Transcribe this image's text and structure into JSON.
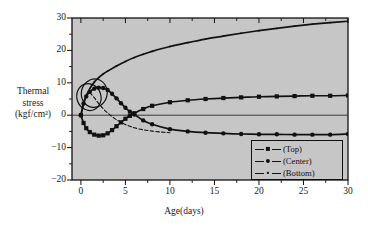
{
  "chart_data": {
    "type": "line",
    "title": "",
    "xlabel": "Age(days)",
    "ylabel": "Thermal stress (kgf/cm²)",
    "ylabel_lines": [
      "Thermal",
      "stress",
      "(kgf/cm²)"
    ],
    "xlim": [
      -1,
      30
    ],
    "ylim": [
      -20,
      30
    ],
    "xticks": [
      0,
      5,
      10,
      15,
      20,
      25,
      30
    ],
    "xtick_labels": [
      "0",
      "5",
      "10",
      "15",
      "20",
      "25",
      "30"
    ],
    "yticks": [
      -20,
      -10,
      0,
      10,
      20,
      30
    ],
    "ytick_labels": [
      "−20",
      "−10",
      "0",
      "10",
      "20",
      "30"
    ],
    "yticks_minor": [
      -15,
      -5,
      5,
      15,
      25
    ],
    "xticks_minor": [
      2.5,
      7.5,
      12.5,
      17.5,
      22.5,
      27.5
    ],
    "grid": false,
    "zero_line": true,
    "plot_bgcolor": "#c6c6c6",
    "fig_bgcolor": "#ffffff",
    "line_color": "#111111",
    "legend_position": "bottom-right",
    "annotation_circles": [
      {
        "cx": 0.9,
        "cy": 5.6,
        "rx": 1.35,
        "ry": 4.2
      },
      {
        "cx": 1.5,
        "cy": 6.8,
        "rx": 1.45,
        "ry": 4.4
      }
    ],
    "series": [
      {
        "name": "(Top)",
        "marker": "square",
        "x": [
          0,
          0.3,
          0.6,
          1.0,
          1.5,
          2.0,
          2.5,
          3.0,
          3.5,
          4.0,
          4.5,
          5.0,
          5.5,
          6.0,
          7.0,
          8.0,
          10.0,
          12.0,
          14.0,
          16.0,
          18.0,
          20.0,
          22.0,
          24.0,
          26.0,
          28.0,
          30.0
        ],
        "y": [
          0.0,
          -2.4,
          -4.0,
          -5.2,
          -6.0,
          -6.3,
          -6.2,
          -5.6,
          -4.6,
          -3.4,
          -2.2,
          -1.1,
          -0.2,
          0.6,
          1.9,
          2.9,
          4.0,
          4.6,
          5.0,
          5.3,
          5.5,
          5.7,
          5.8,
          5.9,
          6.0,
          6.0,
          6.1
        ]
      },
      {
        "name": "(Center)",
        "marker": "circle",
        "x": [
          0,
          0.3,
          0.6,
          1.0,
          1.5,
          2.0,
          2.5,
          3.0,
          3.5,
          4.0,
          4.5,
          5.0,
          5.5,
          6.0,
          7.0,
          8.0,
          10.0,
          12.0,
          14.0,
          16.0,
          18.0,
          20.0,
          22.0,
          24.0,
          26.0,
          28.0,
          30.0
        ],
        "y": [
          0.0,
          3.6,
          5.8,
          7.2,
          8.2,
          8.5,
          8.4,
          7.8,
          6.6,
          5.2,
          3.7,
          2.3,
          1.1,
          0.2,
          -1.6,
          -2.8,
          -4.3,
          -5.0,
          -5.4,
          -5.6,
          -5.8,
          -5.9,
          -5.9,
          -6.0,
          -6.0,
          -6.0,
          -5.8
        ]
      },
      {
        "name": "(Bottom)",
        "marker": "tiny",
        "x": [
          0,
          0.3,
          0.6,
          1.0,
          1.5,
          2.0,
          2.5,
          3.0,
          4.0,
          5.0,
          6.0,
          7.0,
          8.0,
          10.0,
          12.0,
          14.0,
          16.0,
          18.0,
          20.0,
          22.0,
          24.0,
          26.0,
          28.0,
          30.0
        ],
        "y": [
          0.0,
          3.5,
          6.0,
          8.2,
          10.2,
          11.6,
          12.7,
          13.6,
          15.2,
          16.6,
          17.8,
          18.8,
          19.7,
          21.2,
          22.4,
          23.5,
          24.4,
          25.3,
          26.1,
          26.8,
          27.5,
          28.1,
          28.6,
          29.0
        ]
      },
      {
        "name": "(Bottom-early-dashed)",
        "marker": "none",
        "dashed": true,
        "x": [
          1.0,
          1.5,
          2.0,
          2.5,
          3.0,
          3.5,
          4.0,
          4.5,
          5.0,
          5.5,
          6.0,
          7.0,
          8.0,
          9.0,
          10.0
        ],
        "y": [
          7.0,
          5.4,
          3.6,
          2.0,
          0.7,
          -0.4,
          -1.4,
          -2.2,
          -2.9,
          -3.4,
          -3.9,
          -4.5,
          -4.9,
          -5.2,
          -5.4
        ]
      }
    ]
  },
  "legend": {
    "items": [
      {
        "label": "(Top)",
        "marker": "square"
      },
      {
        "label": "(Center)",
        "marker": "circle"
      },
      {
        "label": "(Bottom)",
        "marker": "tiny"
      }
    ]
  }
}
